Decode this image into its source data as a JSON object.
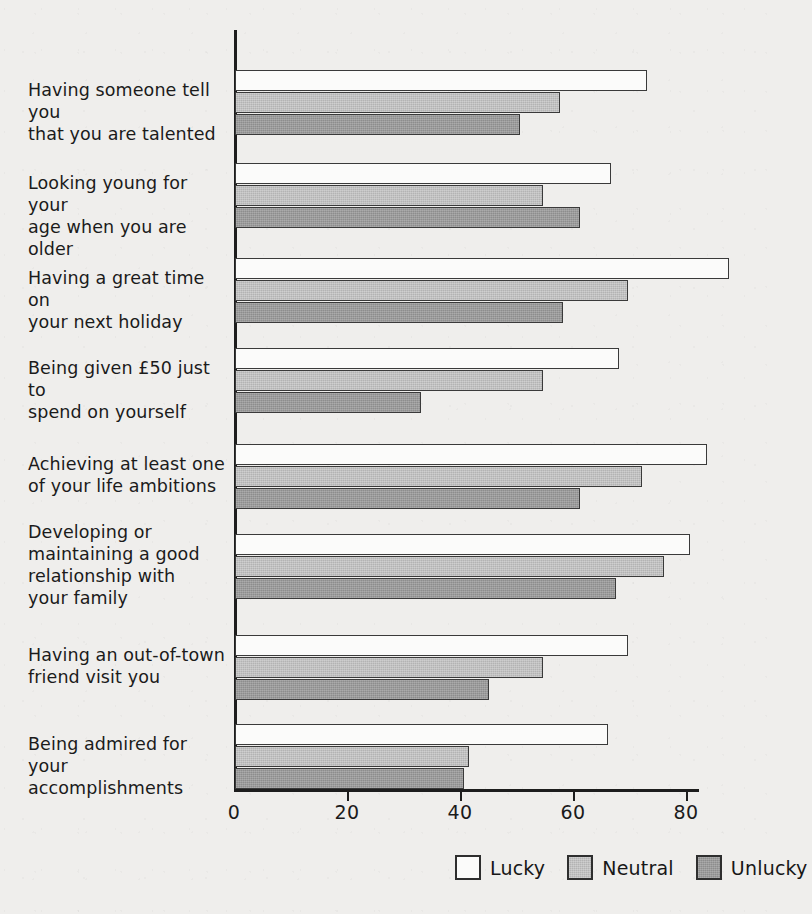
{
  "chart_data": {
    "type": "bar",
    "orientation": "horizontal",
    "title": "",
    "xlabel": "",
    "ylabel": "",
    "xlim": [
      0,
      95
    ],
    "grid": false,
    "legend_position": "bottom-right",
    "xticks": [
      0,
      20,
      40,
      60,
      80
    ],
    "xtick_labels": [
      "0",
      "20",
      "40",
      "60",
      "80"
    ],
    "categories": [
      "Having someone tell you that you are talented",
      "Looking young for your age when you are older",
      "Having a great time on your next holiday",
      "Being given £50 just to spend on yourself",
      "Achieving at least one of your life ambitions",
      "Developing or maintaining a good relationship with your family",
      "Having an out-of-town friend visit you",
      "Being admired for your accomplishments"
    ],
    "category_lines": [
      [
        "Having someone tell you",
        "that you are talented"
      ],
      [
        "Looking young for your",
        "age when you are older"
      ],
      [
        "Having a great time on",
        "your next holiday"
      ],
      [
        "Being given £50 just to",
        "spend on yourself"
      ],
      [
        "Achieving at least one",
        "of your life ambitions"
      ],
      [
        "Developing or",
        "maintaining a good",
        "relationship with",
        "your family"
      ],
      [
        "Having an out-of-town",
        "friend visit you"
      ],
      [
        "Being admired for your",
        "accomplishments"
      ]
    ],
    "series": [
      {
        "name": "Lucky",
        "color": "#fbfbfa",
        "values": [
          73,
          66.5,
          87.5,
          68,
          83.5,
          80.5,
          69.5,
          66
        ]
      },
      {
        "name": "Neutral",
        "color": "#b3b3b3",
        "values": [
          57.5,
          54.5,
          69.5,
          54.5,
          72,
          76,
          54.5,
          41.5
        ]
      },
      {
        "name": "Unlucky",
        "color": "#8d8d8d",
        "values": [
          50.5,
          61,
          58,
          33,
          61,
          67.5,
          45,
          40.5
        ]
      }
    ]
  },
  "legend": {
    "items": [
      {
        "label": "Lucky",
        "swatch": "lucky"
      },
      {
        "label": "Neutral",
        "swatch": "neutral"
      },
      {
        "label": "Unlucky",
        "swatch": "unlucky"
      }
    ]
  }
}
